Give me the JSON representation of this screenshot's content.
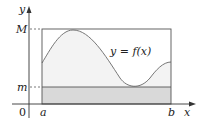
{
  "diagram": {
    "labels": {
      "y_axis": "y",
      "x_axis": "x",
      "M": "M",
      "m": "m",
      "origin": "0",
      "a": "a",
      "b": "b",
      "curve": "y = f(x)"
    },
    "colors": {
      "axis": "#333333",
      "rect_stroke": "#555555",
      "upper_fill": "#f3f3f3",
      "lower_fill": "#d9d9d9",
      "curve": "#777777"
    }
  }
}
